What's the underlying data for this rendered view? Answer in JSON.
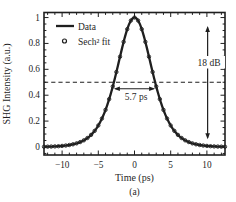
{
  "chart_data": {
    "type": "line",
    "title": "",
    "xlabel": "Time (ps)",
    "ylabel": "SHG Intensity (a.u.)",
    "caption": "(a)",
    "ink_color": "#1f1f1f",
    "background_color": "#ffffff",
    "grid": false,
    "xlim": [
      -12.5,
      12.5
    ],
    "ylim": [
      -0.062,
      1.039
    ],
    "x_tick_values": [
      -10,
      -5,
      0,
      5,
      10
    ],
    "x_tick_labels": [
      "−10",
      "−5",
      "0",
      "5",
      "10"
    ],
    "y_tick_values": [
      1,
      0.8,
      0.6,
      0.4,
      0.2,
      0
    ],
    "y_tick_labels": [
      "1",
      "0.8",
      "0.6",
      "0.4",
      "0.2",
      "0"
    ],
    "x_minor_step_ps": 1,
    "y_minor_step": 0.05,
    "x": [
      -12.5,
      -12,
      -11.5,
      -11,
      -10.5,
      -10,
      -9.5,
      -9,
      -8.5,
      -8,
      -7.5,
      -7,
      -6.5,
      -6,
      -5.5,
      -5,
      -4.5,
      -4,
      -3.5,
      -3,
      -2.5,
      -2,
      -1.5,
      -1,
      -0.5,
      0,
      0.5,
      1,
      1.5,
      2,
      2.5,
      3,
      3.5,
      4,
      4.5,
      5,
      5.5,
      6,
      6.5,
      7,
      7.5,
      8,
      8.5,
      9,
      9.5,
      10,
      10.5,
      11,
      11.5,
      12,
      12.5
    ],
    "y": [
      0.0018,
      0.0024,
      0.0033,
      0.0044,
      0.006,
      0.0082,
      0.0112,
      0.0152,
      0.0206,
      0.028,
      0.038,
      0.0514,
      0.0693,
      0.0933,
      0.1249,
      0.1662,
      0.2195,
      0.2867,
      0.3695,
      0.4678,
      0.5792,
      0.6975,
      0.8123,
      0.9102,
      0.9765,
      1.0,
      0.9765,
      0.9102,
      0.8123,
      0.6975,
      0.5792,
      0.4678,
      0.3695,
      0.2867,
      0.2195,
      0.1662,
      0.1249,
      0.0933,
      0.0693,
      0.0514,
      0.038,
      0.028,
      0.0206,
      0.0152,
      0.0112,
      0.0082,
      0.006,
      0.0044,
      0.0033,
      0.0024,
      0.0018
    ],
    "series": [
      {
        "name": "Data",
        "style": "solid-line",
        "line_width": 2.3
      },
      {
        "name": "Sech² fit",
        "style": "open-circle-markers",
        "model": "sech2",
        "fwhm_ps": 5.7,
        "center_ps": 0,
        "peak": 1.0,
        "marker_step_ps": 0.5
      }
    ],
    "annotations": [
      {
        "type": "dashed-hline",
        "y": 0.5
      },
      {
        "type": "double-arrow-horizontal",
        "label": "5.7 ps",
        "x1": -2.85,
        "x2": 2.85,
        "y": 0.45
      },
      {
        "type": "double-arrow-vertical",
        "label": "18 dB",
        "x": 10.1,
        "y1": 0.06,
        "y2": 0.935
      }
    ],
    "legend": {
      "position": "upper-left",
      "items": [
        {
          "label": "Data",
          "marker": "solid-line"
        },
        {
          "label": "Sech² fit",
          "marker": "open-circle"
        }
      ]
    }
  }
}
